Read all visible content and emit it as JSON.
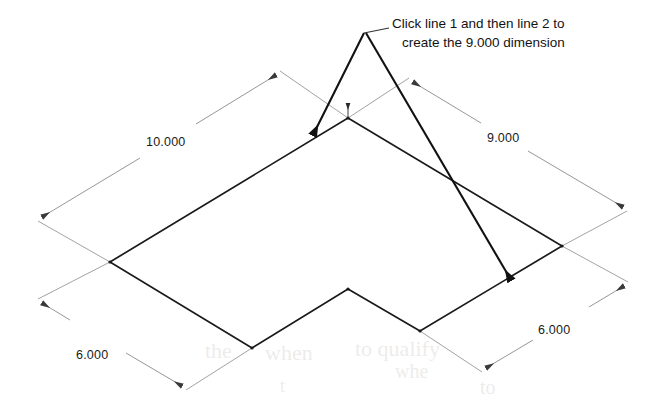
{
  "diagram": {
    "type": "isometric-engineering-drawing",
    "background_color": "#ffffff",
    "outline_color": "#1a1a1a",
    "dimension_line_color": "#808080",
    "annotation_color": "#131313",
    "title": "",
    "callout": {
      "line1": "Click line 1 and then line 2 to",
      "line2": "create the 9.000 dimension",
      "leader_origin": {
        "x": 364,
        "y": 33
      }
    },
    "dimensions": [
      {
        "name": "dimension-10",
        "label": "10.000",
        "value": 10.0,
        "label_x": 146,
        "label_y": 135,
        "edge": "upper-left",
        "start": {
          "x": 42,
          "y": 217
        },
        "end": {
          "x": 276,
          "y": 75
        }
      },
      {
        "name": "dimension-9",
        "label": "9.000",
        "value": 9.0,
        "label_x": 487,
        "label_y": 131,
        "edge": "upper-right",
        "start": {
          "x": 413,
          "y": 82
        },
        "end": {
          "x": 623,
          "y": 207
        }
      },
      {
        "name": "dimension-6-left",
        "label": "6.000",
        "value": 6.0,
        "label_x": 76,
        "label_y": 348,
        "edge": "lower-left",
        "start": {
          "x": 42,
          "y": 303
        },
        "end": {
          "x": 182,
          "y": 386
        }
      },
      {
        "name": "dimension-6-right",
        "label": "6.000",
        "value": 6.0,
        "label_x": 538,
        "label_y": 323,
        "edge": "lower-right",
        "start": {
          "x": 486,
          "y": 368
        },
        "end": {
          "x": 624,
          "y": 286
        }
      }
    ],
    "arrows": [
      {
        "name": "arrow-to-line-1",
        "target": "line 1",
        "from": {
          "x": 364,
          "y": 33
        },
        "to": {
          "x": 313,
          "y": 135
        }
      },
      {
        "name": "arrow-to-line-2",
        "target": "line 2",
        "from": {
          "x": 366,
          "y": 33
        },
        "to": {
          "x": 511,
          "y": 280
        }
      }
    ],
    "shape_outline": [
      {
        "x": 110,
        "y": 262
      },
      {
        "x": 348,
        "y": 118
      },
      {
        "x": 562,
        "y": 246
      },
      {
        "x": 420,
        "y": 331
      },
      {
        "x": 348,
        "y": 289
      },
      {
        "x": 252,
        "y": 348
      }
    ]
  }
}
